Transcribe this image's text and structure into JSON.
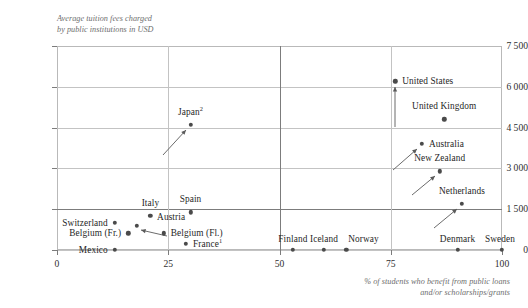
{
  "chart_data": {
    "type": "scatter",
    "title": "",
    "ylabel": "Average tuition fees charged\nby public institutions in USD",
    "xlabel": "% of students who benefit from public loans\nand/or scholarships/grants",
    "xlim": [
      0,
      100
    ],
    "ylim": [
      0,
      7500
    ],
    "xticks": [
      "0",
      "25",
      "50",
      "75",
      "100"
    ],
    "xtick_values": [
      0,
      25,
      50,
      75,
      100
    ],
    "yticks": [
      "0",
      "1 500",
      "3 000",
      "4 500",
      "6 000",
      "7 500"
    ],
    "ytick_values": [
      0,
      1500,
      3000,
      4500,
      6000,
      7500
    ],
    "grid": "both",
    "legend": "none",
    "points": [
      {
        "name": "Mexico",
        "label": "Mexico",
        "x": 13,
        "y": 0,
        "label_side": "left",
        "label_dx": -7,
        "label_dy": 0,
        "leader": false
      },
      {
        "name": "Switzerland",
        "label": "Switzerland",
        "x": 13,
        "y": 1000,
        "label_side": "left",
        "label_dx": -7,
        "label_dy": 0,
        "leader": false
      },
      {
        "name": "Belgium (Fr.)",
        "label": "Belgium (Fr.)",
        "x": 16,
        "y": 620,
        "label_side": "left",
        "label_dx": -7,
        "label_dy": 0,
        "leader": false
      },
      {
        "name": "Italy",
        "label": "Italy",
        "x": 21,
        "y": 1250,
        "label_side": "center",
        "label_dx": 0,
        "label_dy": -13,
        "leader": false
      },
      {
        "name": "Austria",
        "label": "Austria",
        "x": 18,
        "y": 880,
        "label_side": "right",
        "label_dx": 20,
        "label_dy": -9,
        "leader": true,
        "arrow": {
          "x1": 30,
          "y1": 10,
          "x2": 4,
          "y2": 4
        }
      },
      {
        "name": "Belgium (Fl.)",
        "label": "Belgium (Fl.)",
        "x": 24,
        "y": 620,
        "label_side": "right",
        "label_dx": 7,
        "label_dy": 0,
        "leader": false
      },
      {
        "name": "France",
        "label": "France",
        "sup": "1",
        "x": 29,
        "y": 230,
        "label_side": "right",
        "label_dx": 7,
        "label_dy": 0,
        "leader": false
      },
      {
        "name": "Spain",
        "label": "Spain",
        "x": 30,
        "y": 1380,
        "label_side": "center",
        "label_dx": 0,
        "label_dy": -13,
        "leader": false
      },
      {
        "name": "Japan",
        "label": "Japan",
        "sup": "2",
        "x": 30,
        "y": 4600,
        "label_side": "center",
        "label_dx": 0,
        "label_dy": -13,
        "leader": true,
        "arrow": {
          "x1": -28,
          "y1": 30,
          "x2": -5,
          "y2": 5
        }
      },
      {
        "name": "Finland",
        "label": "Finland",
        "x": 53,
        "y": 0,
        "label_side": "center",
        "label_dx": 0,
        "label_dy": -11,
        "leader": false
      },
      {
        "name": "Iceland",
        "label": "Iceland",
        "x": 60,
        "y": 0,
        "label_side": "center",
        "label_dx": 0,
        "label_dy": -11,
        "leader": false
      },
      {
        "name": "Norway",
        "label": "Norway",
        "x": 65,
        "y": 0,
        "label_side": "right",
        "label_dx": 2,
        "label_dy": -11,
        "leader": false
      },
      {
        "name": "United States",
        "label": "United States",
        "x": 76,
        "y": 6200,
        "label_side": "right",
        "label_dx": 7,
        "label_dy": 0,
        "leader": true,
        "arrow": {
          "x1": 0,
          "y1": 46,
          "x2": 0,
          "y2": 6
        }
      },
      {
        "name": "United Kingdom",
        "label": "United Kingdom",
        "x": 87,
        "y": 4800,
        "label_side": "center",
        "label_dx": 0,
        "label_dy": -13,
        "leader": false
      },
      {
        "name": "Australia",
        "label": "Australia",
        "x": 82,
        "y": 3900,
        "label_side": "right",
        "label_dx": 7,
        "label_dy": 0,
        "leader": true,
        "arrow": {
          "x1": -29,
          "y1": 26,
          "x2": -5,
          "y2": 5
        }
      },
      {
        "name": "New Zealand",
        "label": "New Zealand",
        "x": 86,
        "y": 2900,
        "label_side": "center",
        "label_dx": 0,
        "label_dy": -13,
        "leader": true,
        "arrow": {
          "x1": -28,
          "y1": 24,
          "x2": -5,
          "y2": 5
        }
      },
      {
        "name": "Netherlands",
        "label": "Netherlands",
        "x": 91,
        "y": 1700,
        "label_side": "center",
        "label_dx": 0,
        "label_dy": -13,
        "leader": true,
        "arrow": {
          "x1": -28,
          "y1": 24,
          "x2": -5,
          "y2": 5
        }
      },
      {
        "name": "Denmark",
        "label": "Denmark",
        "x": 90,
        "y": 0,
        "label_side": "center",
        "label_dx": 0,
        "label_dy": -11,
        "leader": false
      },
      {
        "name": "Sweden",
        "label": "Sweden",
        "x": 100,
        "y": 0,
        "label_side": "center",
        "label_dx": -2,
        "label_dy": -11,
        "leader": false
      }
    ]
  },
  "colors": {
    "marker": "#4a4a4a",
    "grid": "#c3c3c3",
    "grid_strong": "#7c7c7c",
    "frame": "#b9b9b9",
    "text": "#1f1f1f",
    "axis_title": "#6e6e6e"
  }
}
